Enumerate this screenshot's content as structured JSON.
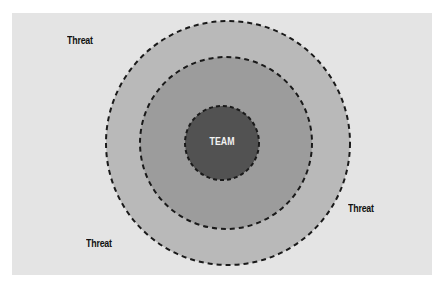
{
  "diagram": {
    "center_label": "TEAM",
    "threat_labels": [
      {
        "text": "Threat",
        "x": 67,
        "y": 34
      },
      {
        "text": "Threat",
        "x": 347,
        "y": 203
      },
      {
        "text": "Threat",
        "x": 86,
        "y": 238
      }
    ],
    "rings": [
      {
        "name": "outer",
        "cx": 228,
        "cy": 143,
        "r": 122,
        "fill": "#b9b9b9"
      },
      {
        "name": "middle",
        "cx": 226,
        "cy": 143,
        "r": 86,
        "fill": "#9a9a9a"
      },
      {
        "name": "inner",
        "cx": 222,
        "cy": 143,
        "r": 37,
        "fill": "#525252"
      }
    ],
    "colors": {
      "background": "#e4e4e4",
      "dash": "#1a1a1a"
    }
  }
}
